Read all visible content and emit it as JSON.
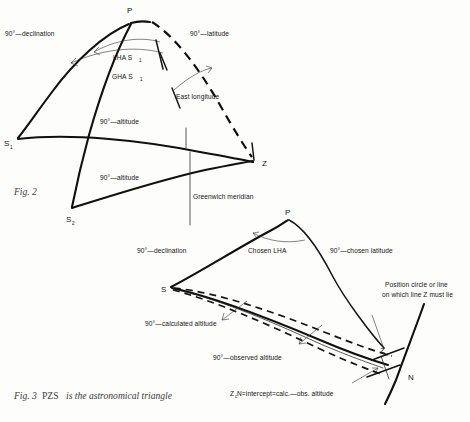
{
  "page": {
    "background": "#fdfdfc",
    "ink": "#131313"
  },
  "figure2": {
    "caption": "Fig. 2",
    "points": {
      "pole": "P",
      "zenith": "Z",
      "star1": "S",
      "star1_sub": "1",
      "star2": "S",
      "star2_sub": "2"
    },
    "labels": {
      "declination": "90°—declination",
      "latitude": "90°—latitude",
      "lha": "LHA S",
      "lha_sub": "1",
      "gha": "GHA S",
      "gha_sub": "1",
      "east_longitude": "East longitude",
      "altitude_upper": "90°—altitude",
      "altitude_lower": "90°—altitude",
      "greenwich_meridian": "Greenwich meridian"
    }
  },
  "figure3": {
    "caption_prefix": "Fig. 3",
    "caption_bold": "PZS",
    "caption_rest": "is the astronomical triangle",
    "points": {
      "pole": "P",
      "star": "S",
      "zenith_calc": "Z",
      "zenith_calc_sub": "c",
      "north": "N"
    },
    "labels": {
      "declination": "90°—declination",
      "chosen_lha": "Chosen LHA",
      "chosen_latitude": "90°—chosen latitude",
      "calculated_altitude": "90°—calculated altitude",
      "observed_altitude": "90°—observed altitude",
      "position_circle_line1": "Position circle or line",
      "position_circle_line2": "on which line Z must lie",
      "intercept_a": "Z",
      "intercept_sub": "c",
      "intercept_b": "N=intercept=calc.—obs. altitude"
    }
  }
}
